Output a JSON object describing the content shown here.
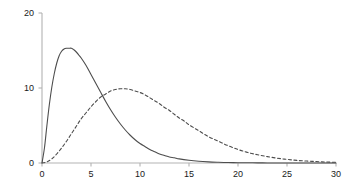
{
  "chart_data": {
    "type": "line",
    "title": "",
    "subtitle": "",
    "xlabel": "",
    "ylabel": "",
    "xlim": [
      0,
      30
    ],
    "ylim": [
      0,
      20
    ],
    "grid": false,
    "legend": "none",
    "axis_color": "#b3b3b3",
    "tick_label_color": "#1a1a1a",
    "xticks": [
      0,
      5,
      10,
      15,
      20,
      25,
      30
    ],
    "xtick_labels": [
      "0",
      "5",
      "10",
      "15",
      "20",
      "25",
      "30"
    ],
    "yticks": [
      0,
      10,
      20
    ],
    "ytick_labels": [
      "0",
      "10",
      "20"
    ],
    "series": [
      {
        "name": "solid-curve",
        "style": "solid",
        "color": "#4d4d4d",
        "width": 1.1,
        "peak_x": 3.0,
        "peak_y": 15.3,
        "x": [
          0,
          0.25,
          0.5,
          0.75,
          1,
          1.25,
          1.5,
          1.75,
          2,
          2.25,
          2.5,
          2.75,
          3,
          3.25,
          3.5,
          3.75,
          4,
          4.5,
          5,
          5.5,
          6,
          6.5,
          7,
          7.5,
          8,
          8.5,
          9,
          9.5,
          10,
          10.5,
          11,
          11.5,
          12,
          12.5,
          13,
          13.5,
          14,
          15,
          16,
          17,
          18,
          19,
          20,
          21,
          22,
          23,
          24,
          25,
          26,
          27,
          28,
          29,
          30
        ],
        "y": [
          0,
          2.0,
          5.0,
          7.8,
          10.1,
          11.9,
          13.3,
          14.3,
          14.9,
          15.2,
          15.3,
          15.3,
          15.3,
          15.1,
          14.8,
          14.4,
          14.0,
          13.0,
          11.8,
          10.6,
          9.4,
          8.2,
          7.1,
          6.1,
          5.2,
          4.4,
          3.7,
          3.1,
          2.6,
          2.2,
          1.8,
          1.5,
          1.2,
          1.0,
          0.8,
          0.7,
          0.55,
          0.36,
          0.23,
          0.15,
          0.1,
          0.06,
          0.04,
          0.03,
          0.02,
          0.01,
          0.01,
          0.0,
          0.0,
          0.0,
          0.0,
          0.0,
          0.0
        ]
      },
      {
        "name": "dashed-curve",
        "style": "dashed",
        "dash_pattern": "3,2.5",
        "color": "#4d4d4d",
        "width": 1.1,
        "peak_x": 8.0,
        "peak_y": 9.9,
        "x": [
          0,
          0.5,
          1,
          1.5,
          2,
          2.5,
          3,
          3.5,
          4,
          4.5,
          5,
          5.5,
          6,
          6.5,
          7,
          7.5,
          8,
          8.5,
          9,
          9.5,
          10,
          10.5,
          11,
          11.5,
          12,
          12.5,
          13,
          13.5,
          14,
          14.5,
          15,
          16,
          17,
          18,
          19,
          20,
          21,
          22,
          23,
          24,
          25,
          26,
          27,
          28,
          29,
          30
        ],
        "y": [
          0,
          0.15,
          0.55,
          1.2,
          2.0,
          2.9,
          3.9,
          4.9,
          5.9,
          6.7,
          7.5,
          8.2,
          8.8,
          9.2,
          9.6,
          9.8,
          9.9,
          9.9,
          9.8,
          9.6,
          9.4,
          9.1,
          8.7,
          8.3,
          7.9,
          7.4,
          7.0,
          6.5,
          6.0,
          5.6,
          5.1,
          4.3,
          3.5,
          2.9,
          2.3,
          1.8,
          1.4,
          1.1,
          0.85,
          0.64,
          0.48,
          0.35,
          0.26,
          0.19,
          0.13,
          0.09
        ]
      }
    ]
  }
}
